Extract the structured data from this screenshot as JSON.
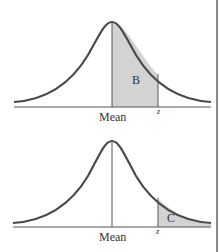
{
  "figure": {
    "top_panel": {
      "region_label": "B",
      "shaded_region": "between mean and z",
      "axis_labels": {
        "mean": "Mean",
        "z": "z"
      }
    },
    "bottom_panel": {
      "region_label": "C",
      "shaded_region": "beyond z (right tail)",
      "axis_labels": {
        "mean": "Mean",
        "z": "z"
      }
    },
    "colors": {
      "curve": "#4a4a4a",
      "shade": "#d3d3d3",
      "axis": "#555555",
      "border": "#8a8a8a"
    }
  }
}
